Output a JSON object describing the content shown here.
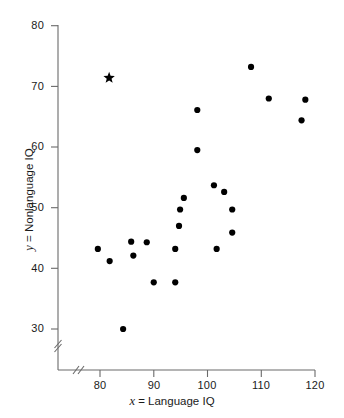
{
  "chart_data": {
    "type": "scatter",
    "title": "",
    "xlabel": "x = Language IQ",
    "ylabel": "y = Nonlanguage IQ",
    "xlabel_var": "x",
    "xlabel_rest": " = Language IQ",
    "ylabel_var": "y",
    "ylabel_rest": " = Nonlanguage IQ",
    "xlim": [
      76,
      121
    ],
    "ylim": [
      28,
      80
    ],
    "xticks": [
      80,
      90,
      100,
      110,
      120
    ],
    "xtick_labels": [
      "80",
      "90",
      "100",
      "110",
      "120"
    ],
    "yticks": [
      30,
      40,
      50,
      60,
      70,
      80
    ],
    "ytick_labels": [
      "30",
      "40",
      "50",
      "60",
      "70",
      "80"
    ],
    "grid": false,
    "legend": false,
    "x_axis_break": true,
    "y_axis_break": true,
    "marker_color": "#000000",
    "axis_color": "#666666",
    "series": [
      {
        "name": "observations",
        "marker": "circle",
        "points": [
          {
            "x": 79.6,
            "y": 43.2
          },
          {
            "x": 81.8,
            "y": 41.2
          },
          {
            "x": 84.3,
            "y": 30.0
          },
          {
            "x": 85.8,
            "y": 44.4
          },
          {
            "x": 86.2,
            "y": 42.1
          },
          {
            "x": 88.7,
            "y": 44.3
          },
          {
            "x": 90.0,
            "y": 37.7
          },
          {
            "x": 94.0,
            "y": 37.7
          },
          {
            "x": 94.0,
            "y": 43.2
          },
          {
            "x": 94.7,
            "y": 47.0
          },
          {
            "x": 94.9,
            "y": 49.7
          },
          {
            "x": 95.6,
            "y": 51.6
          },
          {
            "x": 98.1,
            "y": 66.1
          },
          {
            "x": 98.1,
            "y": 59.5
          },
          {
            "x": 101.2,
            "y": 53.7
          },
          {
            "x": 101.7,
            "y": 43.2
          },
          {
            "x": 103.1,
            "y": 52.6
          },
          {
            "x": 104.6,
            "y": 49.7
          },
          {
            "x": 104.6,
            "y": 45.9
          },
          {
            "x": 108.1,
            "y": 73.2
          },
          {
            "x": 111.4,
            "y": 68.0
          },
          {
            "x": 117.5,
            "y": 64.4
          },
          {
            "x": 118.2,
            "y": 67.8
          }
        ]
      },
      {
        "name": "highlighted-outlier",
        "marker": "star",
        "points": [
          {
            "x": 81.7,
            "y": 71.4
          }
        ]
      }
    ]
  },
  "axes": {
    "y_axis_name": "y-axis",
    "x_axis_name": "x-axis"
  }
}
